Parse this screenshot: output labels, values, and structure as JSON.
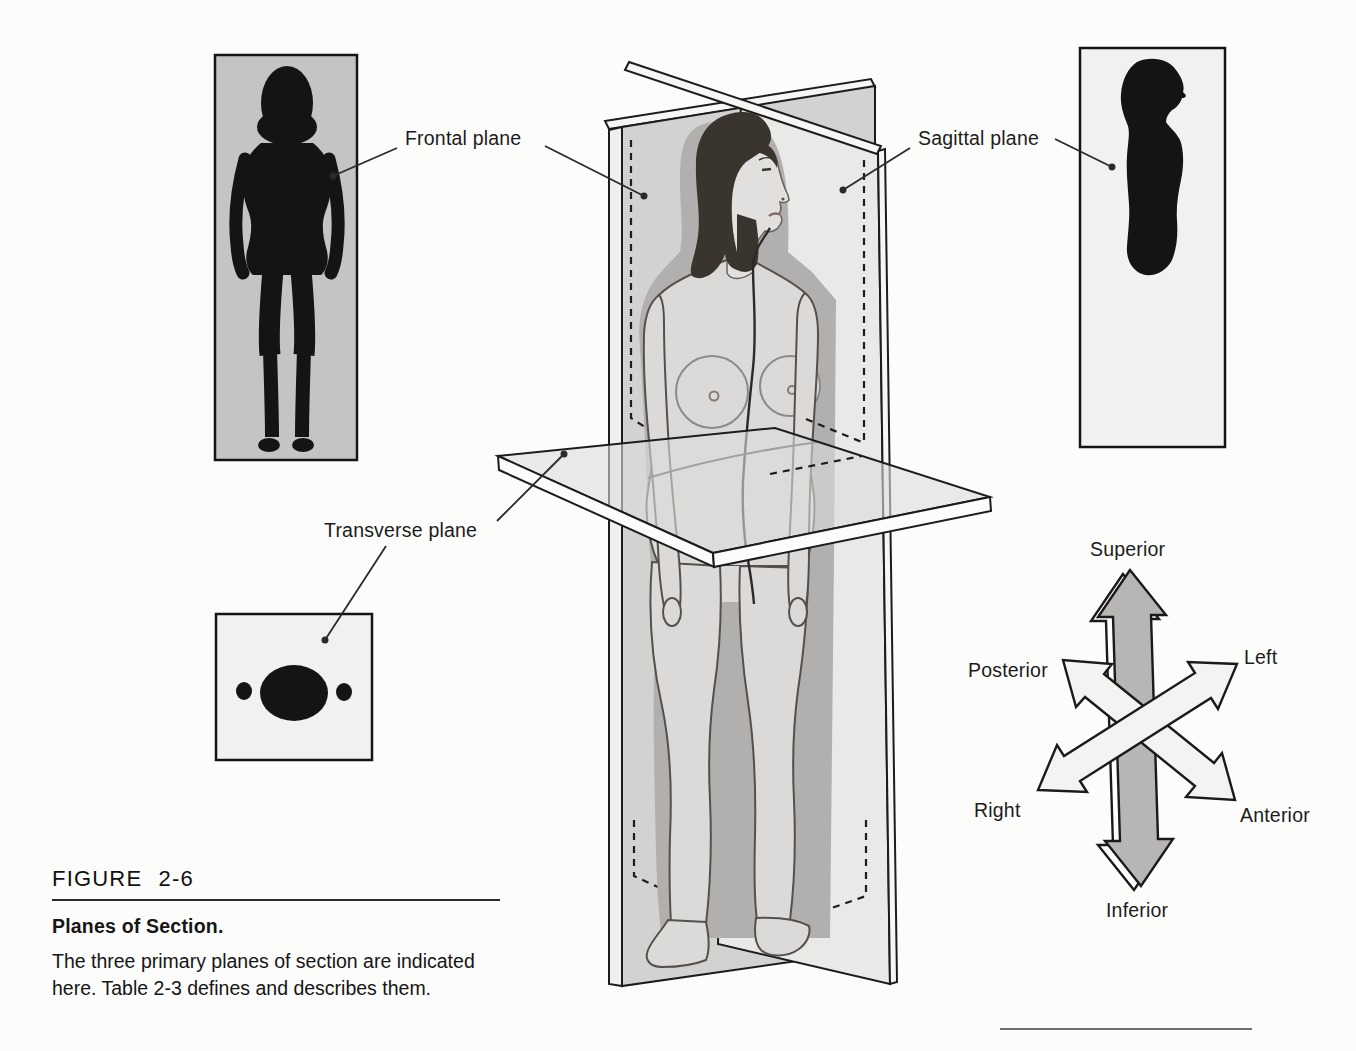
{
  "figure": {
    "plane_labels": {
      "frontal": "Frontal plane",
      "sagittal": "Sagittal plane",
      "transverse": "Transverse plane"
    },
    "compass": {
      "superior": "Superior",
      "inferior": "Inferior",
      "posterior": "Posterior",
      "anterior": "Anterior",
      "left": "Left",
      "right": "Right"
    },
    "caption": {
      "number": "FIGURE 2-6",
      "title": "Planes of Section.",
      "body": "The three primary planes of section are indicated here. Table 2-3 defines and describes them."
    },
    "colors": {
      "page_bg": "#fcfcfb",
      "frontal_plane_fill": "#d2d2d0",
      "sagittal_plane_fill": "#e9e9e7",
      "transverse_plane_fill": "#dcdcda",
      "arrow_dark": "#b8b6b4",
      "arrow_light": "#f3f3f1",
      "silhouette_ink": "#141414",
      "section_box_gray": "#c4c4c2",
      "section_box_light": "#f1f1ef",
      "ink": "#1a1a1a"
    }
  }
}
